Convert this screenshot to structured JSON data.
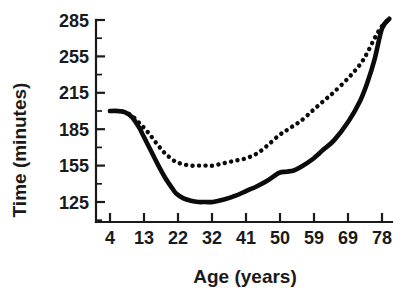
{
  "chart_data": {
    "type": "line",
    "title": "",
    "xlabel": "Age (years)",
    "ylabel": "Time (minutes)",
    "xtick_labels": [
      "4",
      "13",
      "22",
      "32",
      "41",
      "50",
      "59",
      "69",
      "78"
    ],
    "ytick_labels": [
      "285",
      "255",
      "215",
      "185",
      "155",
      "125"
    ],
    "xlim": [
      0,
      82
    ],
    "ylim": [
      110,
      292
    ],
    "grid": false,
    "legend": "none",
    "axis_style": "open-left-bottom",
    "minor_ticks_per_major_y": 1,
    "series": [
      {
        "name": "solid-line",
        "style": "solid",
        "color": "#0b0b0b",
        "x": [
          4,
          6,
          8,
          10,
          12,
          13,
          15,
          17,
          19,
          21,
          22,
          24,
          26,
          28,
          30,
          32,
          35,
          38,
          41,
          44,
          47,
          50,
          52,
          54,
          56,
          59,
          62,
          65,
          69,
          72,
          74,
          76,
          78,
          80
        ],
        "y": [
          200,
          200,
          199,
          195,
          186,
          180,
          168,
          156,
          145,
          136,
          132,
          128,
          126,
          125,
          125,
          125,
          127,
          130,
          134,
          138,
          143,
          149,
          150,
          151,
          154,
          160,
          168,
          176,
          192,
          208,
          226,
          252,
          278,
          286
        ]
      },
      {
        "name": "dotted-line",
        "style": "dotted",
        "color": "#0b0b0b",
        "x": [
          4,
          6,
          8,
          10,
          12,
          13,
          15,
          17,
          19,
          21,
          22,
          24,
          26,
          28,
          30,
          32,
          35,
          38,
          41,
          44,
          47,
          50,
          52,
          54,
          56,
          59,
          62,
          65,
          69,
          72,
          74,
          76,
          78,
          80
        ],
        "y": [
          200,
          200,
          199,
          196,
          190,
          187,
          180,
          172,
          165,
          160,
          158,
          156,
          155,
          155,
          155,
          155,
          157,
          159,
          161,
          165,
          172,
          180,
          184,
          188,
          192,
          200,
          208,
          216,
          232,
          246,
          258,
          270,
          280,
          286
        ]
      }
    ]
  },
  "axes": {
    "y_axis_title": "Time (minutes)",
    "x_axis_title": "Age (years)"
  }
}
